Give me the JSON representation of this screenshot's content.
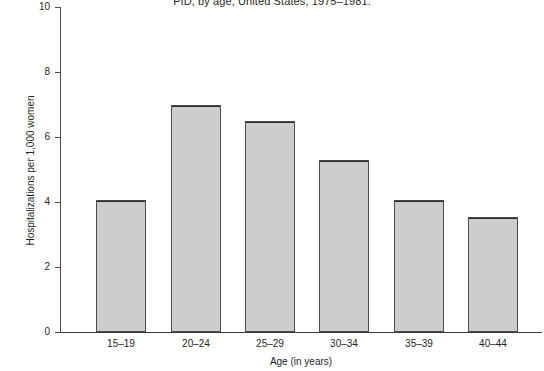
{
  "chart_data": {
    "type": "bar",
    "title": "PID, by age, United States, 1975–1981.",
    "xlabel": "Age (in years)",
    "ylabel": "Hospitalizations per 1,000 women",
    "categories": [
      "15–19",
      "20–24",
      "25–29",
      "30–34",
      "35–39",
      "40–44"
    ],
    "values": [
      4.05,
      7.0,
      6.5,
      5.3,
      4.05,
      3.55
    ],
    "ylim": [
      0,
      10
    ],
    "yticks": [
      0,
      2,
      4,
      6,
      8,
      10
    ],
    "ytick_labels": [
      "0",
      "2",
      "4",
      "6",
      "8",
      "10"
    ],
    "grid": false,
    "legend": null,
    "bar_fill_color": "#cdcdcd",
    "bar_edge_color": "#4c4c4c",
    "axis_color": "#3a3a3a",
    "background_color": "#ffffff"
  }
}
